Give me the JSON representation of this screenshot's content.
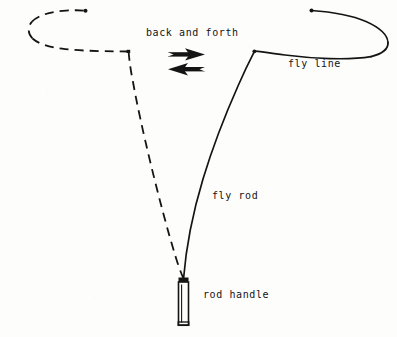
{
  "figure": {
    "background_color": "#fdfdfc",
    "ink_color": "#141414",
    "width": 397,
    "height": 337
  },
  "labels": {
    "back_and_forth": "back and forth",
    "fly_line": "fly line",
    "fly_rod": "fly rod",
    "rod_handle": "rod handle"
  },
  "icons": {
    "arrow_forward": "arrow-right-icon",
    "arrow_backward": "arrow-left-icon"
  },
  "diagram_elements": {
    "rod_handle_shape": "vertical-rectangle",
    "fly_rod_stroke": "solid",
    "fly_line_stroke": "solid",
    "back_cast_line_stroke": "dashed",
    "line_end_marker": "dot"
  }
}
